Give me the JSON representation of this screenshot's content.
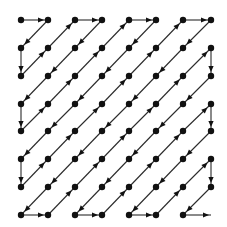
{
  "diagram": {
    "title": "Zigzag scan order (8x8 grid)",
    "type": "zigzag-scan",
    "grid": {
      "rows": 8,
      "cols": 8,
      "x_positions": [
        21,
        48,
        75,
        102,
        129,
        156,
        183,
        211
      ],
      "y_positions": [
        20,
        48,
        76,
        104,
        131,
        159,
        187,
        215
      ]
    },
    "colors": {
      "line": "#2a2a2a",
      "dot": "#111111",
      "background": "#ffffff"
    },
    "dot_radius": 3.2,
    "path": [
      [
        0,
        0
      ],
      [
        0,
        1
      ],
      [
        1,
        0
      ],
      [
        2,
        0
      ],
      [
        1,
        1
      ],
      [
        0,
        2
      ],
      [
        0,
        3
      ],
      [
        1,
        2
      ],
      [
        2,
        1
      ],
      [
        3,
        0
      ],
      [
        4,
        0
      ],
      [
        3,
        1
      ],
      [
        2,
        2
      ],
      [
        1,
        3
      ],
      [
        0,
        4
      ],
      [
        0,
        5
      ],
      [
        1,
        4
      ],
      [
        2,
        3
      ],
      [
        3,
        2
      ],
      [
        4,
        1
      ],
      [
        5,
        0
      ],
      [
        6,
        0
      ],
      [
        5,
        1
      ],
      [
        4,
        2
      ],
      [
        3,
        3
      ],
      [
        2,
        4
      ],
      [
        1,
        5
      ],
      [
        0,
        6
      ],
      [
        0,
        7
      ],
      [
        1,
        6
      ],
      [
        2,
        5
      ],
      [
        3,
        4
      ],
      [
        4,
        3
      ],
      [
        5,
        2
      ],
      [
        6,
        1
      ],
      [
        7,
        0
      ],
      [
        7,
        1
      ],
      [
        6,
        2
      ],
      [
        5,
        3
      ],
      [
        4,
        4
      ],
      [
        3,
        5
      ],
      [
        2,
        6
      ],
      [
        1,
        7
      ],
      [
        2,
        7
      ],
      [
        3,
        6
      ],
      [
        4,
        5
      ],
      [
        5,
        4
      ],
      [
        6,
        3
      ],
      [
        7,
        2
      ],
      [
        7,
        3
      ],
      [
        6,
        4
      ],
      [
        5,
        5
      ],
      [
        4,
        6
      ],
      [
        3,
        7
      ],
      [
        4,
        7
      ],
      [
        5,
        6
      ],
      [
        6,
        5
      ],
      [
        7,
        4
      ],
      [
        7,
        5
      ],
      [
        6,
        6
      ],
      [
        5,
        7
      ],
      [
        6,
        7
      ],
      [
        7,
        6
      ],
      [
        7,
        7
      ]
    ],
    "last_point_has_dot": false
  }
}
